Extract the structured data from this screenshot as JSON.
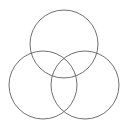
{
  "diagram": {
    "type": "venn",
    "background": "#ffffff",
    "stroke": "#707070",
    "circles": [
      {
        "name": "top",
        "cx": 64,
        "cy": 44,
        "r": 34
      },
      {
        "name": "left",
        "cx": 43,
        "cy": 85,
        "r": 34
      },
      {
        "name": "right",
        "cx": 85,
        "cy": 85,
        "r": 34
      }
    ]
  }
}
